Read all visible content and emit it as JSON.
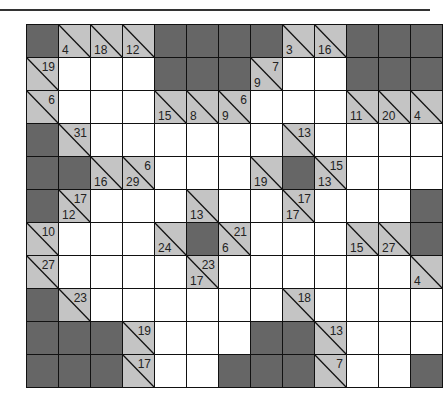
{
  "puzzle": {
    "type": "kakuro",
    "rows": 11,
    "cols": 13,
    "colors": {
      "block": "#666666",
      "clue": "#c4c4c4",
      "white": "#ffffff",
      "line": "#111111"
    },
    "legend": "Each row string: B = blocked, W = empty white cell, c:D/A = clue cell with down sum D and across sum A (empty if none)",
    "grid": [
      [
        "B",
        "c:4/",
        "c:18/",
        "c:12/",
        "B",
        "B",
        "B",
        "B",
        "c:3/",
        "c:16/",
        "B",
        "B",
        "B"
      ],
      [
        "c:/19",
        "W",
        "W",
        "W",
        "B",
        "B",
        "B",
        "c:9/7",
        "W",
        "W",
        "B",
        "B",
        "B"
      ],
      [
        "c:/6",
        "W",
        "W",
        "W",
        "c:15/",
        "c:8/",
        "c:9/6",
        "W",
        "W",
        "W",
        "c:11/",
        "c:20/",
        "c:4/"
      ],
      [
        "B",
        "c:/31",
        "W",
        "W",
        "W",
        "W",
        "W",
        "W",
        "c:/13",
        "W",
        "W",
        "W",
        "W"
      ],
      [
        "B",
        "B",
        "c:16/",
        "c:29/6",
        "W",
        "W",
        "W",
        "c:19/",
        "B",
        "c:13/15",
        "W",
        "W",
        "W"
      ],
      [
        "B",
        "c:12/17",
        "W",
        "W",
        "W",
        "c:13/",
        "W",
        "W",
        "c:17/17",
        "W",
        "W",
        "W",
        "B"
      ],
      [
        "c:/10",
        "W",
        "W",
        "W",
        "c:24/",
        "B",
        "c:6/21",
        "W",
        "W",
        "W",
        "c:15/",
        "c:27/",
        "B"
      ],
      [
        "c:/27",
        "W",
        "W",
        "W",
        "W",
        "c:17/23",
        "W",
        "W",
        "W",
        "W",
        "W",
        "W",
        "c:4/"
      ],
      [
        "B",
        "c:/23",
        "W",
        "W",
        "W",
        "W",
        "W",
        "W",
        "c:/18",
        "W",
        "W",
        "W",
        "W"
      ],
      [
        "B",
        "B",
        "B",
        "c:/19",
        "W",
        "W",
        "W",
        "B",
        "B",
        "c:/13",
        "W",
        "W",
        "W"
      ],
      [
        "B",
        "B",
        "B",
        "c:/17",
        "W",
        "W",
        "B",
        "B",
        "B",
        "c:/7",
        "W",
        "W",
        "B"
      ]
    ]
  }
}
